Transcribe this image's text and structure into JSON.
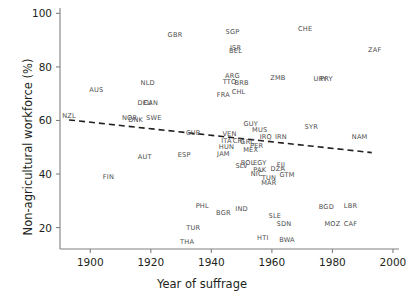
{
  "chart_data": {
    "type": "scatter",
    "title": "",
    "xlabel": "Year of suffrage",
    "ylabel": "Non-agricultural workforce (%)",
    "xlim": [
      1890,
      2002
    ],
    "ylim": [
      12,
      102
    ],
    "xticks": [
      1900,
      1920,
      1940,
      1960,
      1980,
      2000
    ],
    "yticks": [
      20,
      40,
      60,
      80,
      100
    ],
    "grid": false,
    "legend": false,
    "marker_style": "text-label-only",
    "label_color": "#4d4d4d",
    "axis_color": "#808080",
    "trendline": {
      "style": "dashed",
      "color": "#231f20",
      "x_start": 1893,
      "y_start": 60.2,
      "x_end": 1993,
      "y_end": 48.0
    },
    "points": [
      {
        "code": "NZL",
        "x": 1893,
        "y": 61.5
      },
      {
        "code": "AUS",
        "x": 1902,
        "y": 71.5
      },
      {
        "code": "FIN",
        "x": 1906,
        "y": 39.0
      },
      {
        "code": "NOR",
        "x": 1913,
        "y": 61.0
      },
      {
        "code": "DNK",
        "x": 1915,
        "y": 60.0
      },
      {
        "code": "NLD",
        "x": 1919,
        "y": 74.0
      },
      {
        "code": "DEU",
        "x": 1918,
        "y": 66.5
      },
      {
        "code": "CAN",
        "x": 1920,
        "y": 66.5
      },
      {
        "code": "SWE",
        "x": 1921,
        "y": 61.0
      },
      {
        "code": "AUT",
        "x": 1918,
        "y": 46.5
      },
      {
        "code": "GBR",
        "x": 1928,
        "y": 92.0
      },
      {
        "code": "ESP",
        "x": 1931,
        "y": 47.0
      },
      {
        "code": "TUR",
        "x": 1934,
        "y": 20.0
      },
      {
        "code": "THA",
        "x": 1932,
        "y": 14.5
      },
      {
        "code": "PHL",
        "x": 1937,
        "y": 28.0
      },
      {
        "code": "CUB",
        "x": 1934,
        "y": 55.5
      },
      {
        "code": "FRA",
        "x": 1944,
        "y": 69.5
      },
      {
        "code": "BGR",
        "x": 1944,
        "y": 25.5
      },
      {
        "code": "SGP",
        "x": 1947,
        "y": 93.0
      },
      {
        "code": "ISR",
        "x": 1948,
        "y": 87.0
      },
      {
        "code": "BEL",
        "x": 1948,
        "y": 86.0
      },
      {
        "code": "ARG",
        "x": 1947,
        "y": 76.5
      },
      {
        "code": "TTO",
        "x": 1946,
        "y": 74.5
      },
      {
        "code": "BRB",
        "x": 1950,
        "y": 74.0
      },
      {
        "code": "CHL",
        "x": 1949,
        "y": 70.5
      },
      {
        "code": "VEN",
        "x": 1946,
        "y": 55.0
      },
      {
        "code": "ITA",
        "x": 1945,
        "y": 52.5
      },
      {
        "code": "HUN",
        "x": 1945,
        "y": 50.0
      },
      {
        "code": "JAM",
        "x": 1944,
        "y": 47.5
      },
      {
        "code": "MEX",
        "x": 1953,
        "y": 49.0
      },
      {
        "code": "CRI",
        "x": 1949,
        "y": 52.5
      },
      {
        "code": "GRC",
        "x": 1952,
        "y": 52.0
      },
      {
        "code": "PER",
        "x": 1955,
        "y": 50.5
      },
      {
        "code": "IND",
        "x": 1950,
        "y": 27.0
      },
      {
        "code": "SLV",
        "x": 1950,
        "y": 43.0
      },
      {
        "code": "BOL",
        "x": 1952,
        "y": 44.0
      },
      {
        "code": "EGY",
        "x": 1956,
        "y": 44.0
      },
      {
        "code": "PAK",
        "x": 1956,
        "y": 41.5
      },
      {
        "code": "NIC",
        "x": 1955,
        "y": 40.0
      },
      {
        "code": "TUN",
        "x": 1959,
        "y": 38.5
      },
      {
        "code": "MAR",
        "x": 1959,
        "y": 36.5
      },
      {
        "code": "GUY",
        "x": 1953,
        "y": 58.5
      },
      {
        "code": "MUS",
        "x": 1956,
        "y": 56.5
      },
      {
        "code": "ZMB",
        "x": 1962,
        "y": 76.0
      },
      {
        "code": "IRQ",
        "x": 1958,
        "y": 54.0
      },
      {
        "code": "IRN",
        "x": 1963,
        "y": 54.0
      },
      {
        "code": "FJI",
        "x": 1963,
        "y": 43.5
      },
      {
        "code": "DZA",
        "x": 1962,
        "y": 42.0
      },
      {
        "code": "GTM",
        "x": 1965,
        "y": 39.5
      },
      {
        "code": "SLE",
        "x": 1961,
        "y": 24.5
      },
      {
        "code": "SDN",
        "x": 1964,
        "y": 21.5
      },
      {
        "code": "BWA",
        "x": 1965,
        "y": 15.5
      },
      {
        "code": "HTI",
        "x": 1957,
        "y": 16.0
      },
      {
        "code": "CHE",
        "x": 1971,
        "y": 94.0
      },
      {
        "code": "SYR",
        "x": 1973,
        "y": 57.5
      },
      {
        "code": "PRY",
        "x": 1978,
        "y": 75.5
      },
      {
        "code": "URY",
        "x": 1976,
        "y": 75.5
      },
      {
        "code": "BGD",
        "x": 1978,
        "y": 27.5
      },
      {
        "code": "MOZ",
        "x": 1980,
        "y": 21.5
      },
      {
        "code": "LBR",
        "x": 1986,
        "y": 28.0
      },
      {
        "code": "CAF",
        "x": 1986,
        "y": 21.5
      },
      {
        "code": "NAM",
        "x": 1989,
        "y": 54.0
      },
      {
        "code": "ZAF",
        "x": 1994,
        "y": 86.5
      }
    ]
  }
}
